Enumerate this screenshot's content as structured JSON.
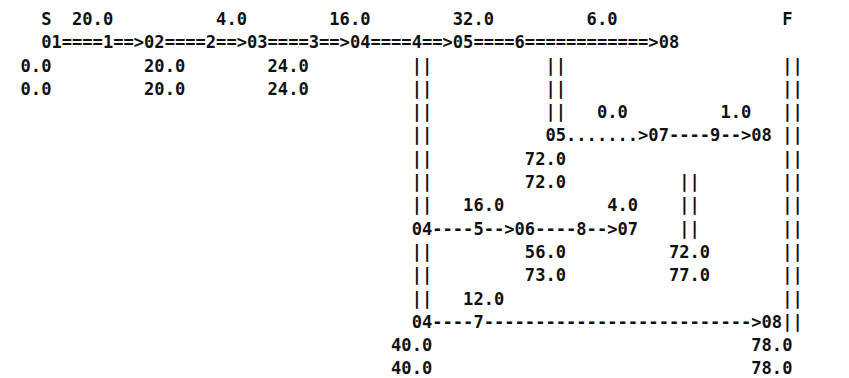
{
  "diagram": {
    "title_markers": {
      "start": "S",
      "finish": "F"
    },
    "char_width_px": 10.27,
    "line_height_px": 23.3,
    "font_weight": "bold",
    "text_color": "#101010",
    "background_color": "#ffffff",
    "lines": [
      "    S  20.0          4.0         16.0         32.0         6.0                    F",
      "    01====1==>02====2==>03====3==>04====4==>05====6============>08",
      "  0.0         20.0        24.0             | |          | |                    | |",
      "  0.0         20.0        24.0             | |          | |                    | |",
      "                                           | |          | |   0.0       1.0    | |",
      "                                           | |          | |                    | |",
      "                                           | |           05.......>07----9-->08",
      "                                           | |         72.0            | |      | |",
      "                                           | |         72.0            | |      | |",
      "                                           | |  16.0         4.0       | |      | |",
      "                                           04----5-->06----8-->07      | |",
      "                                           | |         56.0      72.0         | |",
      "                                           | |         73.0      77.0         | |",
      "                                           | |  12.0                          | |",
      "                                           04----7-------------------------->08",
      "                                        40.0                               78.0",
      "                                        40.0                               78.0"
    ],
    "rows": [
      {
        "id": "row-header-labels",
        "cells": [
          {
            "name": "start-marker",
            "text": "S",
            "col": 4
          },
          {
            "name": "duration-label-1",
            "text": "20.0",
            "col": 7
          },
          {
            "name": "duration-label-2",
            "text": "4.0",
            "col": 21
          },
          {
            "name": "duration-label-3",
            "text": "16.0",
            "col": 32
          },
          {
            "name": "duration-label-4",
            "text": "32.0",
            "col": 44
          },
          {
            "name": "duration-label-6",
            "text": "6.0",
            "col": 57
          },
          {
            "name": "finish-marker",
            "text": "F",
            "col": 76
          }
        ]
      },
      {
        "id": "row-critical-path",
        "text": "01====1==>02====2==>03====3==>04====4==>05====6============>08",
        "col": 4,
        "nodes": [
          "01",
          "02",
          "03",
          "04",
          "05",
          "08"
        ],
        "activities": [
          "1",
          "2",
          "3",
          "4",
          "6"
        ],
        "style": "critical"
      },
      {
        "id": "row-early-times-1",
        "cells": [
          {
            "name": "time-value",
            "text": "0.0",
            "col": 2
          },
          {
            "name": "time-value",
            "text": "20.0",
            "col": 14
          },
          {
            "name": "time-value",
            "text": "24.0",
            "col": 26
          }
        ]
      },
      {
        "id": "row-late-times-1",
        "cells": [
          {
            "name": "time-value",
            "text": "0.0",
            "col": 2
          },
          {
            "name": "time-value",
            "text": "20.0",
            "col": 14
          },
          {
            "name": "time-value",
            "text": "24.0",
            "col": 26
          }
        ]
      },
      {
        "id": "row-labels-2",
        "cells": [
          {
            "name": "duration-label-dummy",
            "text": "0.0",
            "col": 58
          },
          {
            "name": "duration-label-9",
            "text": "1.0",
            "col": 70
          }
        ]
      },
      {
        "id": "row-branch-2",
        "text": "05.......>07----9-->08",
        "col": 53,
        "nodes": [
          "05",
          "07",
          "08"
        ],
        "activities": [
          "9"
        ],
        "style": "dummy-then-dashed"
      },
      {
        "id": "row-early-times-2",
        "cells": [
          {
            "name": "time-value",
            "text": "72.0",
            "col": 51
          }
        ]
      },
      {
        "id": "row-late-times-2",
        "cells": [
          {
            "name": "time-value",
            "text": "72.0",
            "col": 51
          }
        ]
      },
      {
        "id": "row-labels-3",
        "cells": [
          {
            "name": "duration-label-5",
            "text": "16.0",
            "col": 45
          },
          {
            "name": "duration-label-8",
            "text": "4.0",
            "col": 59
          }
        ]
      },
      {
        "id": "row-branch-3",
        "text": "04----5-->06----8-->07",
        "col": 40,
        "nodes": [
          "04",
          "06",
          "07"
        ],
        "activities": [
          "5",
          "8"
        ],
        "style": "dashed"
      },
      {
        "id": "row-early-times-3",
        "cells": [
          {
            "name": "time-value",
            "text": "56.0",
            "col": 51
          },
          {
            "name": "time-value",
            "text": "72.0",
            "col": 65
          }
        ]
      },
      {
        "id": "row-late-times-3",
        "cells": [
          {
            "name": "time-value",
            "text": "73.0",
            "col": 51
          },
          {
            "name": "time-value",
            "text": "77.0",
            "col": 65
          }
        ]
      },
      {
        "id": "row-labels-4",
        "cells": [
          {
            "name": "duration-label-7",
            "text": "12.0",
            "col": 45
          }
        ]
      },
      {
        "id": "row-branch-4",
        "text": "04----7-------------------------->08",
        "col": 40,
        "nodes": [
          "04",
          "08"
        ],
        "activities": [
          "7"
        ],
        "style": "dashed"
      },
      {
        "id": "row-early-times-4",
        "cells": [
          {
            "name": "time-value",
            "text": "40.0",
            "col": 38
          },
          {
            "name": "time-value",
            "text": "78.0",
            "col": 73
          }
        ]
      },
      {
        "id": "row-late-times-4",
        "cells": [
          {
            "name": "time-value",
            "text": "40.0",
            "col": 38
          },
          {
            "name": "time-value",
            "text": "78.0",
            "col": 73
          }
        ]
      }
    ],
    "vertical_connectors": [
      {
        "name": "connector-04",
        "col": 40,
        "from_row": 1,
        "to_row": 14
      },
      {
        "name": "connector-05",
        "col": 53,
        "from_row": 1,
        "to_row": 6
      },
      {
        "name": "connector-07",
        "col": 66,
        "from_row": 6,
        "to_row": 10
      },
      {
        "name": "connector-08",
        "col": 76,
        "from_row": 1,
        "to_row": 14
      }
    ]
  }
}
